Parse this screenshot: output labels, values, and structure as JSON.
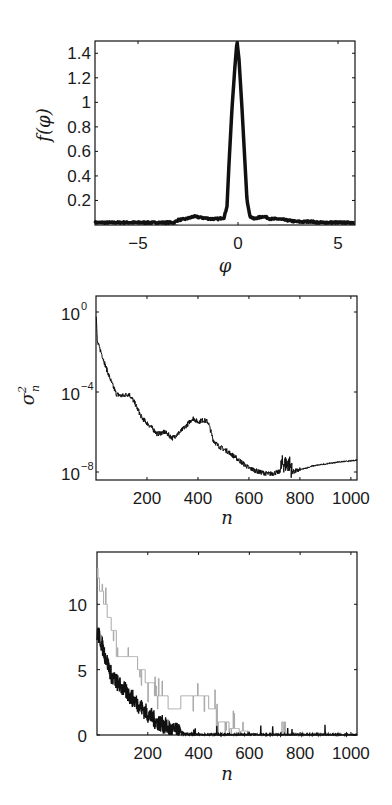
{
  "chart_data": [
    {
      "id": "density",
      "type": "line",
      "title": "",
      "xlabel": "φ",
      "ylabel": "f(φ)",
      "xlim": [
        -7.15,
        5.85
      ],
      "ylim": [
        0,
        1.5
      ],
      "xticks": [
        -5,
        0,
        5
      ],
      "xtick_labels": [
        "−5",
        "0",
        "5"
      ],
      "yticks": [
        0.2,
        0.4,
        0.6,
        0.8,
        1.0,
        1.2,
        1.4
      ],
      "ytick_labels": [
        "0.2",
        "0.4",
        "0.6",
        "0.8",
        "1",
        "1.2",
        "1.4"
      ],
      "grid": false,
      "series": [
        {
          "name": "f(φ)",
          "color": "#111111",
          "width": 3.5,
          "x": [
            -7.15,
            -6,
            -5,
            -4,
            -3.2,
            -3.0,
            -2.6,
            -2.2,
            -1.8,
            -1.4,
            -1.0,
            -0.7,
            -0.55,
            -0.45,
            -0.3,
            -0.15,
            -0.05,
            0.05,
            0.2,
            0.35,
            0.45,
            0.6,
            0.8,
            1.0,
            1.3,
            1.6,
            2.0,
            2.4,
            2.8,
            3.2,
            3.6,
            4.0,
            4.5,
            5.0,
            5.85
          ],
          "y": [
            0.02,
            0.02,
            0.02,
            0.02,
            0.02,
            0.04,
            0.05,
            0.07,
            0.06,
            0.05,
            0.05,
            0.06,
            0.15,
            0.5,
            0.95,
            1.3,
            1.5,
            1.35,
            0.95,
            0.5,
            0.2,
            0.07,
            0.05,
            0.06,
            0.07,
            0.05,
            0.05,
            0.04,
            0.03,
            0.025,
            0.03,
            0.02,
            0.02,
            0.02,
            0.02
          ]
        },
        {
          "name": "reference",
          "color": "#9a9a9a",
          "width": 1,
          "x": [
            -3.0,
            1.5
          ],
          "y": [
            0.005,
            0.005
          ]
        }
      ]
    },
    {
      "id": "variance",
      "type": "line",
      "title": "",
      "xlabel": "n",
      "ylabel": "σ²ₙ",
      "yscale": "log",
      "xlim": [
        0,
        1024
      ],
      "ylim_log10": [
        -8.4,
        0.8
      ],
      "xticks": [
        200,
        400,
        600,
        800,
        1000
      ],
      "xtick_labels": [
        "200",
        "400",
        "600",
        "800",
        "1000"
      ],
      "yticks_log10": [
        0,
        -4,
        -8
      ],
      "ytick_labels": [
        {
          "base": "10",
          "exp": "0"
        },
        {
          "base": "10",
          "exp": "−4"
        },
        {
          "base": "10",
          "exp": "−8"
        }
      ],
      "grid": false,
      "series": [
        {
          "name": "σ²ₙ",
          "color": "#111111",
          "width": 1,
          "noise": 0.25,
          "n": [
            0,
            5,
            20,
            40,
            60,
            80,
            100,
            130,
            150,
            180,
            220,
            240,
            270,
            300,
            330,
            360,
            380,
            400,
            420,
            440,
            460,
            480,
            520,
            560,
            600,
            640,
            680,
            720,
            730,
            760,
            770,
            800,
            850,
            900,
            950,
            1000,
            1024
          ],
          "log10_sigma2": [
            0.2,
            -1.5,
            -2.0,
            -2.8,
            -3.5,
            -4.1,
            -4.2,
            -4.1,
            -4.5,
            -5.3,
            -5.8,
            -6.1,
            -6.0,
            -6.3,
            -6.0,
            -5.6,
            -5.3,
            -5.5,
            -5.4,
            -5.5,
            -6.4,
            -6.7,
            -7.0,
            -7.4,
            -7.8,
            -8.0,
            -8.1,
            -8.0,
            -7.6,
            -7.6,
            -8.0,
            -7.9,
            -7.7,
            -7.6,
            -7.5,
            -7.45,
            -7.4
          ]
        }
      ]
    },
    {
      "id": "counts",
      "type": "line",
      "title": "",
      "xlabel": "n",
      "ylabel": "",
      "xlim": [
        0,
        1024
      ],
      "ylim": [
        0,
        14
      ],
      "xticks": [
        200,
        400,
        600,
        800,
        1000
      ],
      "xtick_labels": [
        "200",
        "400",
        "600",
        "800",
        "1000"
      ],
      "yticks": [
        0,
        5,
        10
      ],
      "ytick_labels": [
        "0",
        "5",
        "10"
      ],
      "grid": false,
      "series": [
        {
          "name": "step (gray)",
          "color": "#a8a8a8",
          "width": 1,
          "step": true,
          "n": [
            0,
            10,
            25,
            40,
            55,
            75,
            130,
            160,
            190,
            225,
            280,
            330,
            370,
            440,
            470,
            500,
            520,
            560,
            600,
            1024
          ],
          "value": [
            12,
            11,
            10,
            9,
            8,
            6,
            6,
            5,
            4,
            3,
            2,
            3,
            3,
            2,
            1,
            1,
            0.5,
            0.3,
            0,
            0
          ]
        },
        {
          "name": "noisy (black)",
          "color": "#111111",
          "width": 1.4,
          "noise": 0.7,
          "n": [
            0,
            10,
            30,
            60,
            90,
            130,
            170,
            200,
            230,
            260,
            290,
            320,
            350,
            400,
            500,
            1024
          ],
          "value": [
            7.8,
            7.5,
            6.2,
            4.4,
            3.8,
            3.0,
            2.2,
            1.6,
            1.1,
            0.8,
            0.4,
            0.2,
            0.05,
            0.03,
            0.02,
            0.0
          ]
        }
      ]
    }
  ]
}
